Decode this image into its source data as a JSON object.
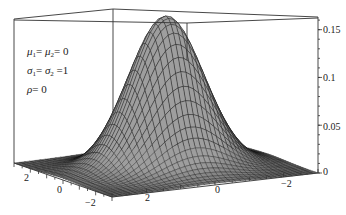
{
  "chart_data": {
    "type": "surface3d",
    "title": "",
    "function": "f(x,y) = (1/(2*pi)) * exp(-(x^2+y^2)/2)",
    "parameters": {
      "mu1": 0,
      "mu2": 0,
      "sigma1": 1,
      "sigma2": 1,
      "rho": 0
    },
    "annotations": [
      "μ1 = μ2 = 0",
      "σ1 = σ2 = 1",
      "ρ = 0"
    ],
    "x_axis": {
      "label": "",
      "ticks": [
        2,
        0,
        -2
      ],
      "range": [
        -3,
        3
      ]
    },
    "y_axis": {
      "label": "",
      "ticks": [
        2,
        0,
        -2
      ],
      "range": [
        -3,
        3
      ]
    },
    "z_axis": {
      "label": "",
      "ticks": [
        0,
        0.05,
        0.1,
        0.15
      ],
      "range": [
        0,
        0.16
      ]
    },
    "peak_value": 0.159,
    "mesh": true,
    "box": true,
    "colors": {
      "surface": "#555555",
      "mesh": "#111111",
      "box": "#333333"
    }
  },
  "annotation_lines": {
    "line1": {
      "a": "μ",
      "a_sub": "1",
      "eq1": "= ",
      "b": "μ",
      "b_sub": "2",
      "eq2": "= ",
      "val": "0"
    },
    "line2": {
      "a": "σ",
      "a_sub": "1",
      "eq1": "= ",
      "b": "σ",
      "b_sub": "2",
      "eq2": " =",
      "val": "1"
    },
    "line3": {
      "a": "ρ",
      "eq1": "= ",
      "val": "0"
    }
  },
  "tick_labels": {
    "z": [
      "0.15",
      "0.1",
      "0.05",
      "0"
    ],
    "left_axis": [
      "2",
      "0",
      "−2"
    ],
    "front_axis": [
      "2",
      "0",
      "−2"
    ]
  }
}
